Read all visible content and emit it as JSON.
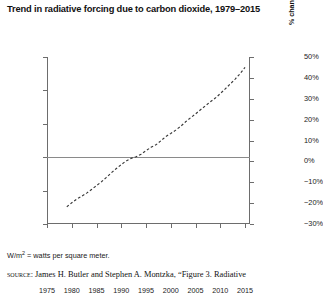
{
  "title": "Trend in radiative forcing due to carbon dioxide, 1979–2015",
  "footnote": "= watts per square meter.",
  "footnote_unit_base": "W/m",
  "footnote_unit_exp": "2",
  "source": {
    "label": "source:",
    "text": "James H. Butler and Stephen A. Montzka, “Figure 3. Radiative"
  },
  "axis_titles": {
    "left": "Radiative forcing since 1750 (W/m²)",
    "right": "% change relative to 1990"
  },
  "chart_data": {
    "type": "line",
    "title": "Trend in radiative forcing due to carbon dioxide, 1979–2015",
    "xlabel": "",
    "ylabel": "Radiative forcing since 1750 (W/m²)",
    "ylabel_right": "% change relative to 1990",
    "xlim": [
      1975,
      2016
    ],
    "ylim": [
      0.9,
      1.9
    ],
    "ylim_right": [
      -30,
      50
    ],
    "grid": false,
    "legend": "none",
    "line_style": "dashed",
    "reference_line": {
      "value": 1.3,
      "label_left": "1.3",
      "label_right": "0%"
    },
    "xticks": [
      1975,
      1980,
      1985,
      1990,
      1995,
      2000,
      2005,
      2010,
      2015
    ],
    "xtick_labels": [
      "1975",
      "1980",
      "1985",
      "1990",
      "1995",
      "2000",
      "2005",
      "2010",
      "2015"
    ],
    "yticks_left": [
      0.9,
      1.1,
      1.3,
      1.5,
      1.7,
      1.9
    ],
    "ytick_labels_left": [
      "0.9",
      "1.1",
      "1.3",
      "1.5",
      "1.7",
      "1.9"
    ],
    "yticks_right": [
      -30,
      -20,
      -10,
      0,
      10,
      20,
      30,
      40,
      50
    ],
    "ytick_labels_right": [
      "−30%",
      "−20%",
      "−10%",
      "0%",
      "10%",
      "20%",
      "30%",
      "40%",
      "50%"
    ],
    "x": [
      1979,
      1980,
      1981,
      1982,
      1983,
      1984,
      1985,
      1986,
      1987,
      1988,
      1989,
      1990,
      1991,
      1992,
      1993,
      1994,
      1995,
      1996,
      1997,
      1998,
      1999,
      2000,
      2001,
      2002,
      2003,
      2004,
      2005,
      2006,
      2007,
      2008,
      2009,
      2010,
      2011,
      2012,
      2013,
      2014,
      2015
    ],
    "values": [
      1.003,
      1.027,
      1.049,
      1.066,
      1.085,
      1.107,
      1.13,
      1.153,
      1.179,
      1.207,
      1.232,
      1.256,
      1.278,
      1.293,
      1.303,
      1.318,
      1.339,
      1.359,
      1.374,
      1.398,
      1.424,
      1.442,
      1.462,
      1.485,
      1.512,
      1.536,
      1.559,
      1.584,
      1.608,
      1.632,
      1.654,
      1.681,
      1.709,
      1.738,
      1.768,
      1.8,
      1.838
    ],
    "series": [
      {
        "name": "Radiative forcing from carbon dioxide",
        "values": [
          1.003,
          1.027,
          1.049,
          1.066,
          1.085,
          1.107,
          1.13,
          1.153,
          1.179,
          1.207,
          1.232,
          1.256,
          1.278,
          1.293,
          1.303,
          1.318,
          1.339,
          1.359,
          1.374,
          1.398,
          1.424,
          1.442,
          1.462,
          1.485,
          1.512,
          1.536,
          1.559,
          1.584,
          1.608,
          1.632,
          1.654,
          1.681,
          1.709,
          1.738,
          1.768,
          1.8,
          1.838
        ]
      }
    ]
  }
}
